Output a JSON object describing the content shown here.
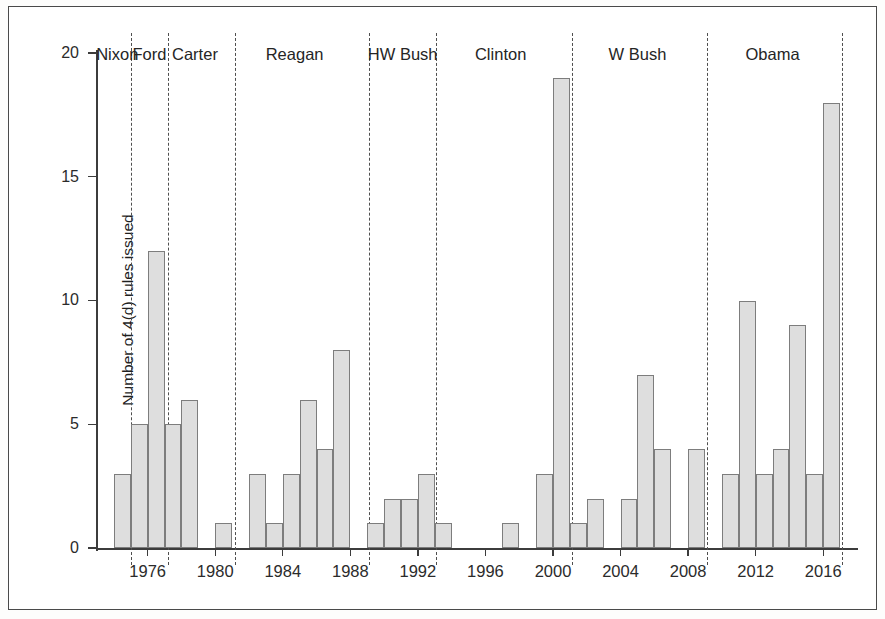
{
  "chart_data": {
    "type": "bar",
    "title": "",
    "subtitle": "",
    "xlabel": "",
    "ylabel": "Number of 4(d) rules issued",
    "xlim": [
      1973,
      2018
    ],
    "ylim": [
      0,
      20
    ],
    "yticks": [
      0,
      5,
      10,
      15,
      20
    ],
    "xticks": [
      1976,
      1980,
      1984,
      1988,
      1992,
      1996,
      2000,
      2004,
      2008,
      2012,
      2016
    ],
    "grid": false,
    "legend": null,
    "bar_color": "#dedede",
    "bar_edge_color": "#7d7d7d",
    "axis_color": "#3c3c3c",
    "divider_color": "#4f4f4f",
    "categories": [
      1974,
      1975,
      1976,
      1977,
      1978,
      1980,
      1982,
      1983,
      1984,
      1985,
      1986,
      1987,
      1989,
      1990,
      1991,
      1992,
      1993,
      1997,
      1999,
      2000,
      2001,
      2002,
      2004,
      2005,
      2006,
      2008,
      2010,
      2011,
      2012,
      2013,
      2014,
      2015,
      2016
    ],
    "values": [
      3,
      5,
      12,
      5,
      6,
      1,
      3,
      1,
      3,
      6,
      4,
      8,
      1,
      2,
      2,
      3,
      1,
      1,
      3,
      19,
      1,
      2,
      2,
      7,
      4,
      4,
      3,
      10,
      3,
      4,
      9,
      3,
      18
    ],
    "annotations": [
      {
        "label": "Nixon",
        "center_year": 1974.2,
        "start_year": 1973.0,
        "end_year": 1975.0
      },
      {
        "label": "Ford",
        "center_year": 1976.1,
        "start_year": 1975.0,
        "end_year": 1977.2
      },
      {
        "label": "Carter",
        "center_year": 1978.8,
        "start_year": 1977.2,
        "end_year": 1981.2
      },
      {
        "label": "Reagan",
        "center_year": 1984.7,
        "start_year": 1981.2,
        "end_year": 1989.1
      },
      {
        "label": "HW Bush",
        "center_year": 1991.1,
        "start_year": 1989.1,
        "end_year": 1993.1
      },
      {
        "label": "Clinton",
        "center_year": 1996.9,
        "start_year": 1993.1,
        "end_year": 2001.1
      },
      {
        "label": "W Bush",
        "center_year": 2005.0,
        "start_year": 2001.1,
        "end_year": 2009.1
      },
      {
        "label": "Obama",
        "center_year": 2013.0,
        "start_year": 2009.1,
        "end_year": 2017.1
      }
    ],
    "dividers": [
      1975.0,
      1977.2,
      1981.2,
      1989.1,
      1993.1,
      2001.1,
      2009.1,
      2017.1
    ]
  }
}
